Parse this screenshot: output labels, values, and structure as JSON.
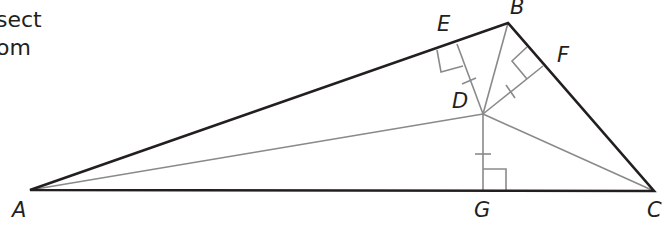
{
  "caption": {
    "line1": "sect",
    "line2": "om"
  },
  "figure": {
    "stroke_dark": "#231f20",
    "stroke_light": "#8a8a8a",
    "points": {
      "A": {
        "label": "A",
        "x": 30,
        "y": 190
      },
      "B": {
        "label": "B",
        "x": 508,
        "y": 23
      },
      "C": {
        "label": "C",
        "x": 654,
        "y": 191
      },
      "D": {
        "label": "D",
        "x": 483,
        "y": 114
      },
      "E": {
        "label": "E",
        "x": 457,
        "y": 44
      },
      "F": {
        "label": "F",
        "x": 543,
        "y": 66
      },
      "G": {
        "label": "G",
        "x": 483,
        "y": 190
      }
    },
    "triangle": [
      "A",
      "B",
      "C"
    ],
    "segments_from_D": [
      "A",
      "B",
      "C",
      "E",
      "F",
      "G"
    ],
    "right_angles": [
      "E",
      "F",
      "G"
    ],
    "congruent_ticks": [
      "DE",
      "DF",
      "DG"
    ]
  }
}
